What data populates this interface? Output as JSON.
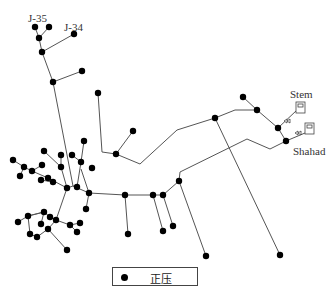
{
  "labels": {
    "j35": "J-35",
    "j34": "J-34",
    "stem": "Stem",
    "shahad": "Shahad"
  },
  "legend": {
    "entries": [
      {
        "symbol": "filled-circle",
        "label": "正压"
      }
    ]
  },
  "colors": {
    "node": "#000000",
    "pipe": "#444444",
    "background": "#ffffff"
  },
  "network": {
    "reservoirs": [
      {
        "name": "Stem",
        "x": 297,
        "y": 102
      },
      {
        "name": "Shahad",
        "x": 310,
        "y": 100
      }
    ]
  }
}
